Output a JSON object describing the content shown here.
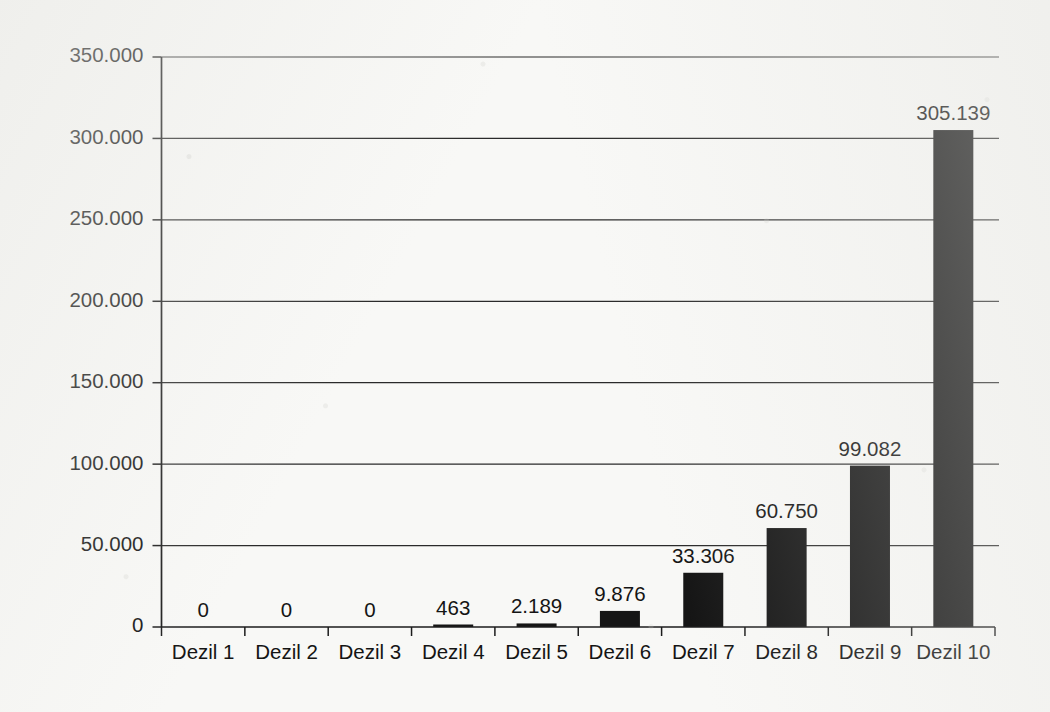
{
  "chart_data": {
    "type": "bar",
    "title": "",
    "subtitle": "",
    "xlabel": "",
    "ylabel": "",
    "categories": [
      "Dezil 1",
      "Dezil 2",
      "Dezil 3",
      "Dezil 4",
      "Dezil 5",
      "Dezil 6",
      "Dezil 7",
      "Dezil 8",
      "Dezil 9",
      "Dezil 10"
    ],
    "values": [
      0,
      0,
      0,
      463,
      2189,
      9876,
      33306,
      60750,
      99082,
      305139
    ],
    "value_labels": [
      "0",
      "0",
      "0",
      "463",
      "2.189",
      "9.876",
      "33.306",
      "60.750",
      "99.082",
      "305.139"
    ],
    "ylim": [
      0,
      350000
    ],
    "ytick_values": [
      0,
      50000,
      100000,
      150000,
      200000,
      250000,
      300000,
      350000
    ],
    "ytick_labels": [
      "0",
      "50.000",
      "100.000",
      "150.000",
      "200.000",
      "250.000",
      "300.000",
      "350.000"
    ],
    "grid": "horizontal",
    "legend": "none",
    "bar_color": "#151515",
    "background_color": "#f8f8f6",
    "axis_color": "#1c1c1c",
    "number_format": "de-DE (period thousands separator)"
  }
}
